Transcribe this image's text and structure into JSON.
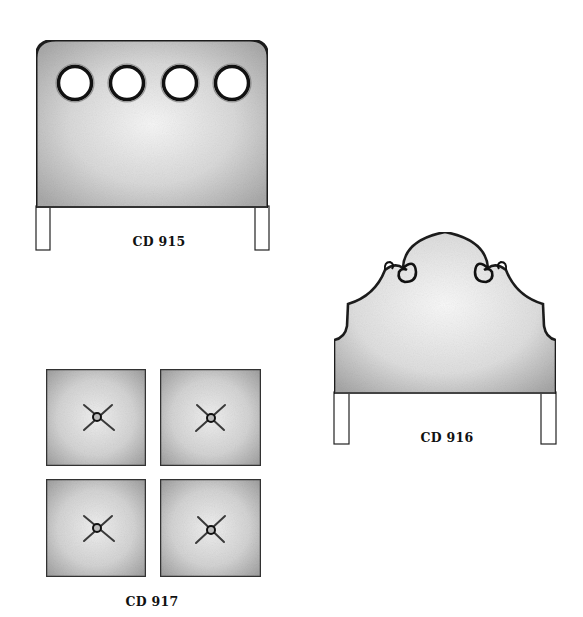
{
  "page": {
    "background": "#ffffff",
    "ink_color": "#1a1a1a",
    "fabric_light": "#f2f2f2",
    "fabric_dark": "#9a9a9a"
  },
  "items": [
    {
      "code": "CD 915",
      "style": "rounded rectangular headboard with four round portholes and straight legs",
      "porthole_count": 4
    },
    {
      "code": "CD 916",
      "style": "arched camelback headboard with scroll volutes and straight legs"
    },
    {
      "code": "CD 917",
      "style": "set of four square tufted panels, each with a single center button",
      "panel_count": 4
    }
  ]
}
